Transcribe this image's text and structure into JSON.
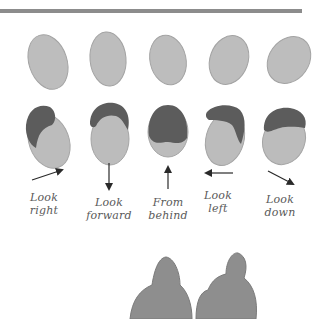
{
  "illustration": {
    "title": "Head directions illustration",
    "colors": {
      "bar": "#8c8c8c",
      "face": "#b9b9b9",
      "face_outline": "#9a9a9a",
      "hair": "#5f5f5f",
      "arrow": "#2a2a2a",
      "figure": "#8a8a8a",
      "label": "#5a5a5a"
    },
    "directions": [
      {
        "id": "look-right",
        "line1": "Look",
        "line2": "right",
        "arrow": "up-right"
      },
      {
        "id": "look-forward",
        "line1": "Look",
        "line2": "forward",
        "arrow": "down"
      },
      {
        "id": "from-behind",
        "line1": "From",
        "line2": "behind",
        "arrow": "up"
      },
      {
        "id": "look-left",
        "line1": "Look",
        "line2": "left",
        "arrow": "left"
      },
      {
        "id": "look-down",
        "line1": "Look",
        "line2": "down",
        "arrow": "down-right"
      }
    ]
  }
}
